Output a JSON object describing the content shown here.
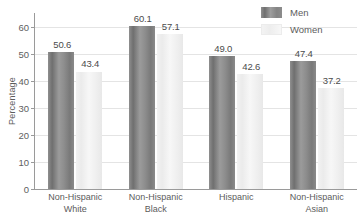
{
  "chart_data": {
    "type": "bar",
    "title": "",
    "xlabel": "",
    "ylabel": "Percentage",
    "ylim": [
      0,
      65
    ],
    "yticks": [
      0,
      10,
      20,
      30,
      40,
      50,
      60
    ],
    "ytick_labels": [
      "0",
      "10",
      "20",
      "30",
      "40",
      "50",
      "60"
    ],
    "grid": "horizontal",
    "legend_position": "top-right",
    "categories": [
      "Non-Hispanic\nWhite",
      "Non-Hispanic\nBlack",
      "Hispanic",
      "Non-Hispanic\nAsian"
    ],
    "category_lines": [
      [
        "Non-Hispanic",
        "White"
      ],
      [
        "Non-Hispanic",
        "Black"
      ],
      [
        "Hispanic",
        ""
      ],
      [
        "Non-Hispanic",
        "Asian"
      ]
    ],
    "series": [
      {
        "name": "Men",
        "color": "#828282",
        "values": [
          50.6,
          60.1,
          49.0,
          47.4
        ],
        "labels": [
          "50.6",
          "60.1",
          "49.0",
          "47.4"
        ]
      },
      {
        "name": "Women",
        "color": "#f1f1f1",
        "values": [
          43.4,
          57.1,
          42.6,
          37.2
        ],
        "labels": [
          "43.4",
          "57.1",
          "42.6",
          "37.2"
        ]
      }
    ]
  },
  "axis": {
    "y_title": "Percentage",
    "tick_0": "0",
    "tick_10": "10",
    "tick_20": "20",
    "tick_30": "30",
    "tick_40": "40",
    "tick_50": "50",
    "tick_60": "60"
  },
  "legend": {
    "items": [
      {
        "label": "Men"
      },
      {
        "label": "Women"
      }
    ]
  },
  "colors": {
    "men_bar": "#828282",
    "women_bar": "#f1f1f1",
    "axis": "#9a9a9a",
    "gridline": "#e4e4e4",
    "text": "#5c5c5c",
    "value_text": "#4b4b4b",
    "background": "#ffffff"
  }
}
